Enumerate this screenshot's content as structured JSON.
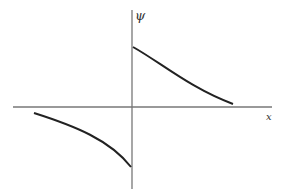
{
  "diagram": {
    "y_axis_label": "ψ",
    "x_axis_label": "x",
    "colors": {
      "axis": "#777777",
      "curve": "#222222",
      "background": "#ffffff"
    }
  }
}
